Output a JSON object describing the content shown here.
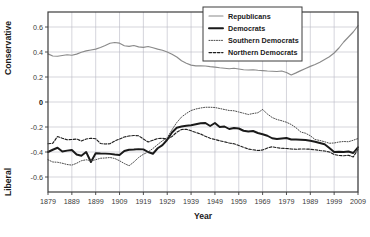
{
  "chart_data": {
    "type": "line",
    "title": "",
    "xlabel": "Year",
    "ylabel": "",
    "ylabel_top": "Conservative",
    "ylabel_bottom": "Liberal",
    "xlim": [
      1879,
      2009
    ],
    "ylim": [
      -0.72,
      0.72
    ],
    "grid": true,
    "legend_position": "top-right-inside",
    "xticks": [
      1879,
      1889,
      1899,
      1909,
      1919,
      1929,
      1939,
      1949,
      1959,
      1969,
      1979,
      1989,
      1999,
      2009
    ],
    "xtick_labels": [
      "1879",
      "1889",
      "1899",
      "1909",
      "1919",
      "1929",
      "1939",
      "1949",
      "1959",
      "1969",
      "1979",
      "1989",
      "1999",
      "2009"
    ],
    "yticks": [
      0.6,
      0.4,
      0.2,
      0,
      -0.2,
      -0.4,
      -0.6
    ],
    "ytick_labels": [
      "0.6",
      "0.4",
      "0.2",
      "0",
      "-0.2",
      "-0.4",
      "-0.6"
    ],
    "x": [
      1879,
      1881,
      1883,
      1885,
      1887,
      1889,
      1891,
      1893,
      1895,
      1897,
      1899,
      1901,
      1903,
      1905,
      1907,
      1909,
      1911,
      1913,
      1915,
      1917,
      1919,
      1921,
      1923,
      1925,
      1927,
      1929,
      1931,
      1933,
      1935,
      1937,
      1939,
      1941,
      1943,
      1945,
      1947,
      1949,
      1951,
      1953,
      1955,
      1957,
      1959,
      1961,
      1963,
      1965,
      1967,
      1969,
      1971,
      1973,
      1975,
      1977,
      1979,
      1981,
      1983,
      1985,
      1987,
      1989,
      1991,
      1993,
      1995,
      1997,
      1999,
      2001,
      2003,
      2005,
      2007,
      2009
    ],
    "series": [
      {
        "name": "Republicans",
        "style": "solid-thin",
        "color": "#8a8a8a",
        "values": [
          0.385,
          0.368,
          0.366,
          0.372,
          0.378,
          0.374,
          0.383,
          0.398,
          0.409,
          0.416,
          0.423,
          0.436,
          0.452,
          0.47,
          0.476,
          0.471,
          0.45,
          0.445,
          0.452,
          0.441,
          0.437,
          0.444,
          0.434,
          0.423,
          0.414,
          0.4,
          0.382,
          0.36,
          0.33,
          0.31,
          0.295,
          0.289,
          0.29,
          0.288,
          0.283,
          0.279,
          0.274,
          0.27,
          0.266,
          0.27,
          0.264,
          0.258,
          0.256,
          0.258,
          0.254,
          0.251,
          0.248,
          0.246,
          0.244,
          0.248,
          0.236,
          0.216,
          0.233,
          0.251,
          0.268,
          0.285,
          0.3,
          0.318,
          0.34,
          0.362,
          0.392,
          0.432,
          0.48,
          0.52,
          0.56,
          0.61
        ]
      },
      {
        "name": "Democrats",
        "style": "solid-thick",
        "color": "#1a1a1a",
        "values": [
          -0.4,
          -0.382,
          -0.366,
          -0.396,
          -0.389,
          -0.384,
          -0.42,
          -0.43,
          -0.4,
          -0.48,
          -0.41,
          -0.412,
          -0.413,
          -0.415,
          -0.42,
          -0.424,
          -0.392,
          -0.382,
          -0.38,
          -0.377,
          -0.379,
          -0.4,
          -0.414,
          -0.37,
          -0.345,
          -0.302,
          -0.244,
          -0.206,
          -0.196,
          -0.19,
          -0.186,
          -0.178,
          -0.17,
          -0.168,
          -0.192,
          -0.168,
          -0.2,
          -0.196,
          -0.216,
          -0.208,
          -0.212,
          -0.23,
          -0.236,
          -0.232,
          -0.248,
          -0.258,
          -0.27,
          -0.29,
          -0.296,
          -0.292,
          -0.288,
          -0.3,
          -0.3,
          -0.302,
          -0.304,
          -0.31,
          -0.318,
          -0.328,
          -0.338,
          -0.368,
          -0.4,
          -0.398,
          -0.4,
          -0.396,
          -0.408,
          -0.362
        ]
      },
      {
        "name": "Southern Democrats",
        "style": "dotted",
        "color": "#4a4a4a",
        "values": [
          -0.462,
          -0.48,
          -0.482,
          -0.49,
          -0.5,
          -0.505,
          -0.49,
          -0.47,
          -0.462,
          -0.47,
          -0.462,
          -0.45,
          -0.448,
          -0.444,
          -0.452,
          -0.47,
          -0.492,
          -0.51,
          -0.48,
          -0.444,
          -0.418,
          -0.4,
          -0.372,
          -0.34,
          -0.31,
          -0.286,
          -0.222,
          -0.164,
          -0.12,
          -0.092,
          -0.068,
          -0.056,
          -0.048,
          -0.042,
          -0.042,
          -0.044,
          -0.052,
          -0.06,
          -0.068,
          -0.07,
          -0.08,
          -0.09,
          -0.1,
          -0.092,
          -0.086,
          -0.06,
          -0.096,
          -0.124,
          -0.14,
          -0.15,
          -0.162,
          -0.18,
          -0.206,
          -0.24,
          -0.25,
          -0.27,
          -0.3,
          -0.308,
          -0.318,
          -0.33,
          -0.328,
          -0.32,
          -0.316,
          -0.318,
          -0.306,
          -0.292
        ]
      },
      {
        "name": "Northern Democrats",
        "style": "dashed",
        "color": "#1f1f1f",
        "values": [
          -0.334,
          -0.33,
          -0.276,
          -0.29,
          -0.302,
          -0.3,
          -0.296,
          -0.312,
          -0.296,
          -0.29,
          -0.294,
          -0.332,
          -0.336,
          -0.334,
          -0.312,
          -0.296,
          -0.28,
          -0.272,
          -0.268,
          -0.27,
          -0.296,
          -0.32,
          -0.306,
          -0.292,
          -0.29,
          -0.298,
          -0.276,
          -0.242,
          -0.22,
          -0.218,
          -0.23,
          -0.244,
          -0.256,
          -0.274,
          -0.29,
          -0.3,
          -0.31,
          -0.318,
          -0.328,
          -0.334,
          -0.348,
          -0.362,
          -0.376,
          -0.382,
          -0.388,
          -0.384,
          -0.368,
          -0.358,
          -0.366,
          -0.37,
          -0.372,
          -0.376,
          -0.378,
          -0.376,
          -0.376,
          -0.378,
          -0.382,
          -0.388,
          -0.392,
          -0.4,
          -0.42,
          -0.428,
          -0.43,
          -0.426,
          -0.44,
          -0.378
        ]
      }
    ]
  },
  "legend": {
    "items": [
      {
        "label": "Republicans"
      },
      {
        "label": "Democrats"
      },
      {
        "label": "Southern Democrats"
      },
      {
        "label": "Northern Democrats"
      }
    ]
  },
  "colors": {
    "republicans": "#8a8a8a",
    "democrats": "#1a1a1a",
    "southern_democrats": "#4a4a4a",
    "northern_democrats": "#1f1f1f",
    "grid": "#b9b9c4",
    "frame": "#3c3c3c",
    "background": "#ffffff"
  }
}
